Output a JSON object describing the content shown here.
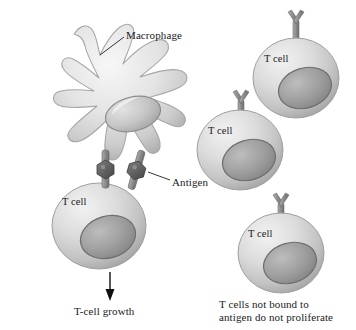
{
  "figure": {
    "background_color": "#ffffff",
    "width": 356,
    "height": 330
  },
  "labels": {
    "macrophage": "Macrophage",
    "antigen": "Antigen",
    "tcell_growth": "T-cell growth",
    "caption_line1": "T cells not bound to",
    "caption_line2": "antigen do not proliferate"
  },
  "cells": {
    "tcell_label": "T cell",
    "tcell_top_right": "T cell",
    "tcell_middle_right": "T cell",
    "tcell_bound": "T cell",
    "tcell_bottom_right": "T cell"
  },
  "colors": {
    "cell_body_light": "#e8e8e8",
    "cell_body_mid": "#cfcfcf",
    "cell_body_dark": "#a9a9a9",
    "nucleus_light": "#b9b9b9",
    "nucleus_dark": "#8a8a8a",
    "nucleus_outline": "#6e6e6e",
    "receptor": "#8c8c8c",
    "receptor_dark": "#6f6f6f",
    "antigen_dark": "#5a5a5a",
    "outline": "#9a9a9a",
    "text": "#1a1a1a",
    "arrow": "#111111"
  },
  "icons": {
    "receptor": "y-receptor-icon",
    "antigen": "antigen-icon",
    "arrow": "down-arrow-icon",
    "leader": "leader-line"
  }
}
